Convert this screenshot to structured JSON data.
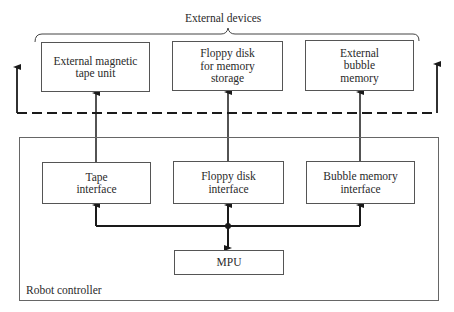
{
  "external_group": {
    "label": "External devices",
    "devices": [
      {
        "label": "External magnetic tape unit"
      },
      {
        "label": "Floppy disk for memory storage"
      },
      {
        "label": "External bubble memory"
      }
    ]
  },
  "controller": {
    "label": "Robot controller",
    "interfaces": [
      {
        "label": "Tape interface"
      },
      {
        "label": "Floppy disk interface"
      },
      {
        "label": "Bubble memory interface"
      }
    ],
    "cpu": {
      "label": "MPU"
    }
  },
  "colors": {
    "line": "#1a1a1a",
    "box_border": "#555555",
    "background": "#ffffff"
  }
}
